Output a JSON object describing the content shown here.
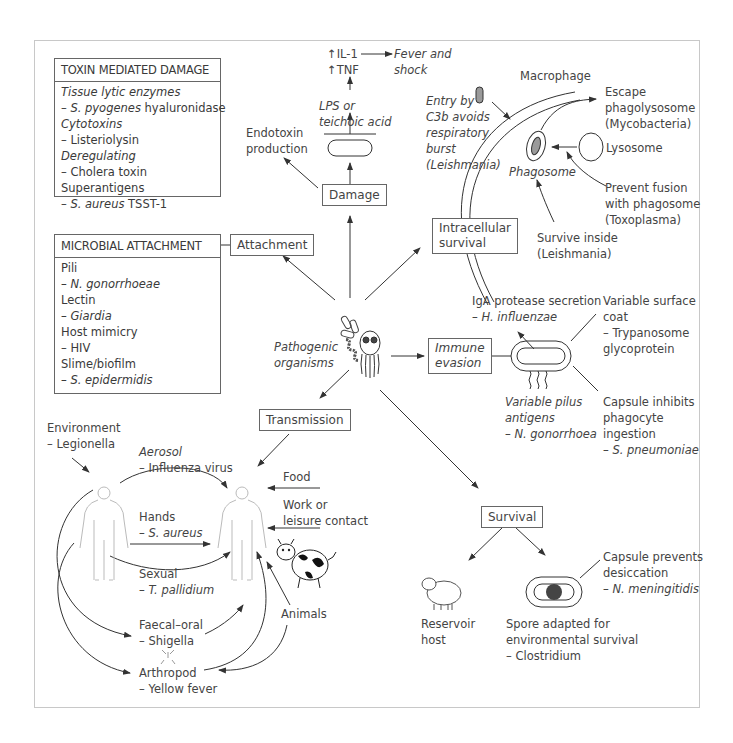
{
  "center": {
    "label_line1": "Pathogenic",
    "label_line2": "organisms"
  },
  "toxin_panel": {
    "title": "TOXIN MEDIATED DAMAGE",
    "items": [
      {
        "text": "Tissue lytic enzymes",
        "italic": true
      },
      {
        "prefix": "– ",
        "italic_part": "S. pyogenes",
        "text": " hyaluronidase"
      },
      {
        "text": "Cytotoxins",
        "italic": true
      },
      {
        "text": "– Listeriolysin"
      },
      {
        "text": "Deregulating",
        "italic": true
      },
      {
        "text": "– Cholera toxin"
      },
      {
        "text": "Superantigens"
      },
      {
        "prefix": "– ",
        "italic_part": "S. aureus",
        "text": " TSST-1"
      }
    ]
  },
  "attachment_panel": {
    "title": "MICROBIAL ATTACHMENT",
    "items": [
      {
        "text": "Pili"
      },
      {
        "text": "– N. gonorrhoeae",
        "italic": true
      },
      {
        "text": "Lectin"
      },
      {
        "text": "– Giardia",
        "italic": true
      },
      {
        "text": "Host mimicry"
      },
      {
        "text": "– HIV"
      },
      {
        "text": "Slime/biofilm"
      },
      {
        "text": "– S. epidermidis",
        "italic": true
      }
    ]
  },
  "boxes": {
    "damage": "Damage",
    "attachment": "Attachment",
    "intracellular_line1": "Intracellular",
    "intracellular_line2": "survival",
    "immune_line1": "Immune",
    "immune_line2": "evasion",
    "transmission": "Transmission",
    "survival": "Survival"
  },
  "damage_branch": {
    "il1": "↑IL-1",
    "tnf": "↑TNF",
    "fever_line1": "Fever and",
    "fever_line2": "shock",
    "lps_line1": "LPS or",
    "lps_line2": "teichoic acid",
    "endotoxin_line1": "Endotoxin",
    "endotoxin_line2": "production"
  },
  "intracellular_branch": {
    "macrophage": "Macrophage",
    "entry": [
      "Entry by",
      "C3b avoids",
      "respiratory",
      "burst",
      "(Leishmania)"
    ],
    "escape": [
      "Escape",
      "phagolysosome",
      "(Mycobacteria)"
    ],
    "lysosome": "Lysosome",
    "phagosome": "Phagosome",
    "prevent": [
      "Prevent fusion",
      "with phagosome",
      "(Toxoplasma)"
    ],
    "survive": [
      "Survive inside",
      "(Leishmania)"
    ]
  },
  "immune_branch": {
    "iga": [
      "IgA protease secretion",
      "– H. influenzae"
    ],
    "variable_coat": [
      "Variable surface",
      "coat",
      "– Trypanosome",
      "glycoprotein"
    ],
    "pilus": [
      "Variable pilus",
      "antigens",
      "– N. gonorrhoea"
    ],
    "capsule": [
      "Capsule inhibits",
      "phagocyte",
      " ingestion",
      "– S. pneumoniae"
    ]
  },
  "transmission_branch": {
    "environment": [
      "Environment",
      "– Legionella"
    ],
    "aerosol": [
      "Aerosol",
      "– Influenza virus"
    ],
    "hands": [
      "Hands",
      "– S. aureus"
    ],
    "sexual": [
      "Sexual",
      "– T. pallidium"
    ],
    "faecal": [
      "Faecal–oral",
      "– Shigella"
    ],
    "arthropod": [
      "Arthropod",
      "– Yellow fever"
    ],
    "food": "Food",
    "work": [
      "Work or",
      "leisure contact"
    ],
    "animals": "Animals"
  },
  "survival_branch": {
    "reservoir": [
      "Reservoir",
      "host"
    ],
    "spore": [
      "Spore adapted for",
      "environmental survival",
      "– Clostridium"
    ],
    "capsule": [
      "Capsule prevents",
      "desiccation",
      "– N. meningitidis"
    ]
  },
  "colors": {
    "line": "#333333",
    "text": "#444444",
    "frame": "#c8c8c8",
    "fill_dark": "#555555",
    "fill_grey": "#9a9a9a"
  }
}
